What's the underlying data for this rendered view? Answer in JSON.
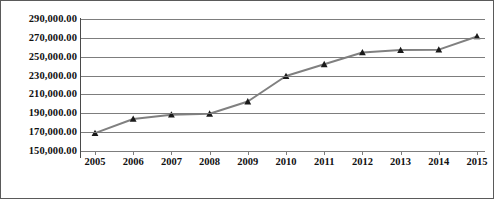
{
  "chart_data": {
    "type": "line",
    "title": "",
    "xlabel": "",
    "ylabel": "",
    "x": [
      2005,
      2006,
      2007,
      2008,
      2009,
      2010,
      2011,
      2012,
      2013,
      2014,
      2015
    ],
    "categories": [
      "2005",
      "2006",
      "2007",
      "2008",
      "2009",
      "2010",
      "2011",
      "2012",
      "2013",
      "2014",
      "2015"
    ],
    "values": [
      169000,
      184000,
      188500,
      189500,
      202500,
      229500,
      242000,
      254500,
      257000,
      257500,
      271500
    ],
    "series": [
      {
        "name": "",
        "values": [
          169000,
          184000,
          188500,
          189500,
          202500,
          229500,
          242000,
          254500,
          257000,
          257500,
          271500
        ]
      }
    ],
    "ylim": [
      150000,
      290000
    ],
    "ytick_values": [
      290000,
      270000,
      250000,
      230000,
      210000,
      190000,
      170000,
      150000
    ],
    "ytick_labels": [
      "290,000.00",
      "270,000.00",
      "250,000.00",
      "230,000.00",
      "210,000.00",
      "190,000.00",
      "170,000.00",
      "150,000.00"
    ],
    "xtick_labels": [
      "2005",
      "2006",
      "2007",
      "2008",
      "2009",
      "2010",
      "2011",
      "2012",
      "2013",
      "2014",
      "2015"
    ],
    "grid": true,
    "legend": false,
    "legend_position": "none",
    "marker": "triangle",
    "colors": {
      "line": "#808080",
      "marker": "#1a1a1a",
      "gridline": "#7d7d7d",
      "axis": "#4a4a4a",
      "text": "#111111",
      "background": "#ffffff",
      "border": "#5a5a5a"
    }
  }
}
